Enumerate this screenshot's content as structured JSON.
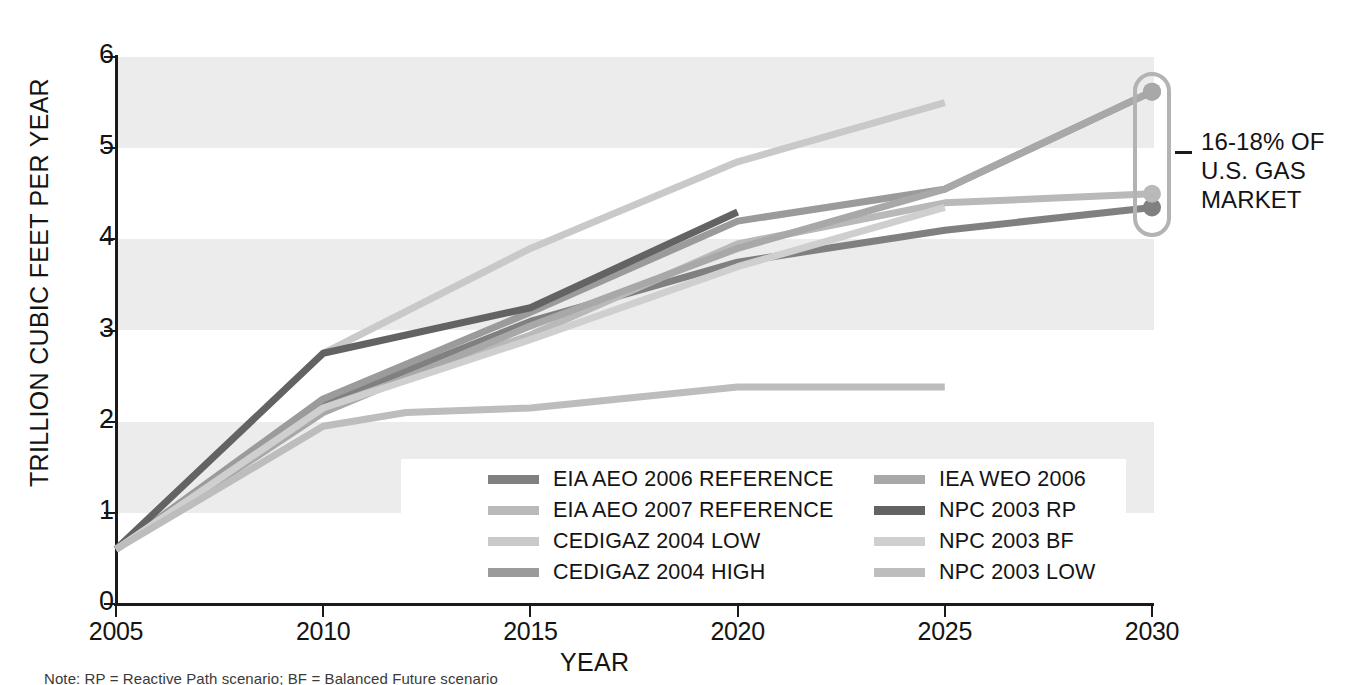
{
  "chart_data": {
    "type": "line",
    "title": "",
    "xlabel": "YEAR",
    "ylabel": "TRILLION CUBIC FEET PER YEAR",
    "xlim": [
      2005,
      2030
    ],
    "ylim": [
      0,
      6
    ],
    "xticks": [
      2005,
      2010,
      2015,
      2020,
      2025,
      2030
    ],
    "yticks": [
      0,
      1,
      2,
      3,
      4,
      5,
      6
    ],
    "grid": "alternating horizontal bands",
    "legend_position": "inside-bottom-center",
    "series": [
      {
        "name": "EIA AEO 2006 REFERENCE",
        "color": "#808080",
        "x": [
          2005,
          2010,
          2015,
          2020,
          2025,
          2030
        ],
        "y": [
          0.6,
          2.2,
          3.1,
          3.75,
          4.1,
          4.35
        ],
        "endpoint_marker": true
      },
      {
        "name": "EIA AEO 2007 REFERENCE",
        "color": "#b9b9b9",
        "x": [
          2005,
          2010,
          2015,
          2020,
          2025,
          2030
        ],
        "y": [
          0.6,
          2.15,
          2.95,
          3.95,
          4.4,
          4.5
        ],
        "endpoint_marker": true
      },
      {
        "name": "CEDIGAZ 2004 LOW",
        "color": "#c9c9c9",
        "x": [
          2005,
          2010,
          2015,
          2020,
          2025
        ],
        "y": [
          0.6,
          2.75,
          3.9,
          4.85,
          5.5
        ],
        "endpoint_marker": false
      },
      {
        "name": "CEDIGAZ 2004 HIGH",
        "color": "#9b9b9b",
        "x": [
          2005,
          2010,
          2015,
          2020,
          2025,
          2030
        ],
        "y": [
          0.6,
          2.25,
          3.2,
          4.2,
          4.55,
          5.62
        ],
        "endpoint_marker": true
      },
      {
        "name": "IEA WEO 2006",
        "color": "#a8a8a8",
        "x": [
          2005,
          2010,
          2015,
          2020,
          2025,
          2030
        ],
        "y": [
          0.6,
          2.1,
          3.05,
          3.9,
          4.55,
          5.62
        ],
        "endpoint_marker": true
      },
      {
        "name": "NPC 2003 RP",
        "color": "#636363",
        "x": [
          2005,
          2010,
          2015,
          2020
        ],
        "y": [
          0.6,
          2.75,
          3.25,
          4.3
        ],
        "endpoint_marker": false
      },
      {
        "name": "NPC 2003 BF",
        "color": "#cfcfcf",
        "x": [
          2005,
          2010,
          2015,
          2020,
          2025
        ],
        "y": [
          0.6,
          2.15,
          2.9,
          3.7,
          4.35
        ],
        "endpoint_marker": false
      },
      {
        "name": "NPC 2003 LOW",
        "color": "#bdbdbd",
        "x": [
          2005,
          2010,
          2012,
          2015,
          2020,
          2025
        ],
        "y": [
          0.6,
          1.95,
          2.1,
          2.15,
          2.38,
          2.38
        ],
        "endpoint_marker": false
      }
    ],
    "annotations": [
      {
        "id": "market-share-callout",
        "lines": [
          "16-18% OF",
          "U.S. GAS",
          "MARKET"
        ],
        "attached_to_x": 2030,
        "attached_to_y_range": [
          4.35,
          5.62
        ],
        "style": "rounded-bracket",
        "color": "#b3b3b3"
      }
    ],
    "bands": [
      {
        "from": 1,
        "to": 2,
        "color": "#ececec"
      },
      {
        "from": 3,
        "to": 4,
        "color": "#ececec"
      },
      {
        "from": 5,
        "to": 6,
        "color": "#ececec"
      }
    ]
  },
  "axes": {
    "y_title": "TRILLION CUBIC FEET PER YEAR",
    "x_title": "YEAR",
    "y_tick_labels": [
      "6",
      "5",
      "4",
      "3",
      "2",
      "1",
      "0"
    ],
    "x_tick_labels": [
      "2005",
      "2010",
      "2015",
      "2020",
      "2025",
      "2030"
    ]
  },
  "legend": {
    "columns": [
      {
        "items": [
          {
            "label": "EIA AEO 2006 REFERENCE",
            "color": "#808080"
          },
          {
            "label": "EIA AEO 2007 REFERENCE",
            "color": "#b9b9b9"
          },
          {
            "label": "CEDIGAZ 2004 LOW",
            "color": "#c9c9c9"
          },
          {
            "label": "CEDIGAZ 2004 HIGH",
            "color": "#9b9b9b"
          }
        ]
      },
      {
        "items": [
          {
            "label": "IEA WEO 2006",
            "color": "#a8a8a8"
          },
          {
            "label": "NPC 2003 RP",
            "color": "#636363"
          },
          {
            "label": "NPC 2003 BF",
            "color": "#cfcfcf"
          },
          {
            "label": "NPC 2003 LOW",
            "color": "#bdbdbd"
          }
        ]
      }
    ]
  },
  "callout": {
    "line1": "16-18% OF",
    "line2": "U.S. GAS",
    "line3": "MARKET"
  },
  "footnote": {
    "text": "Note: RP = Reactive Path scenario; BF = Balanced Future scenario"
  }
}
